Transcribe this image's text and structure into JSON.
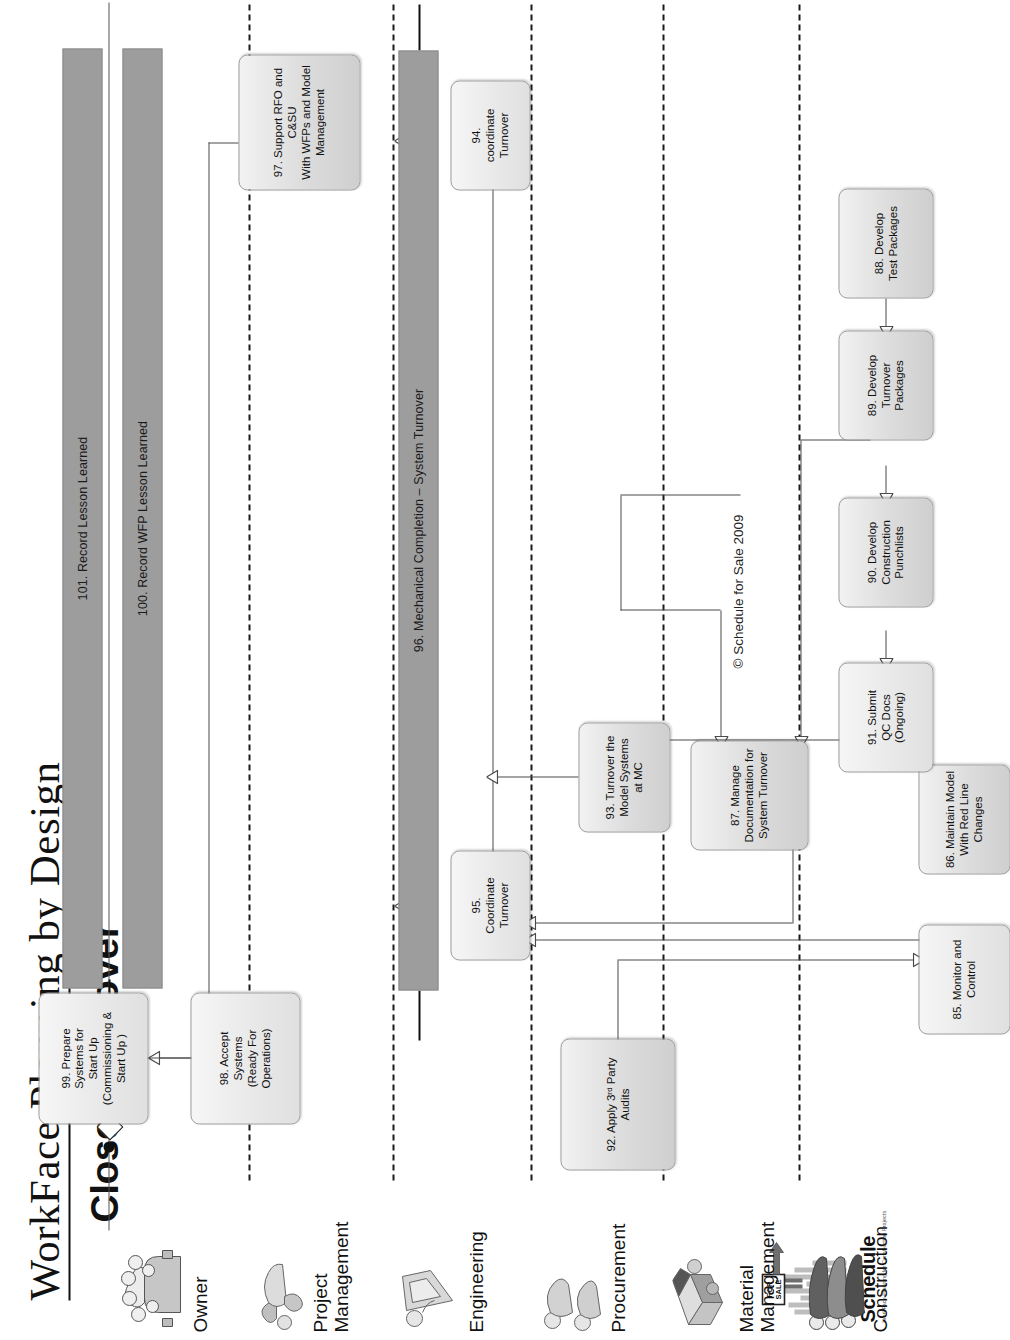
{
  "title": "WorkFace Planning by Design",
  "subtitle": "Close - Turnover",
  "copyright": "© Schedule for Sale 2009",
  "logo": {
    "word": "Schedule",
    "sign": "FOR\nSALE",
    "tagline": "WorkFace Planning for Construction Projects"
  },
  "lanes": [
    {
      "id": "owner",
      "label": "Owner",
      "icon": "people-group-icon"
    },
    {
      "id": "project",
      "label": "Project\nManagement",
      "icon": "person-pointing-icon"
    },
    {
      "id": "engineering",
      "label": "Engineering",
      "icon": "person-document-icon"
    },
    {
      "id": "procurement",
      "label": "Procurement",
      "icon": "two-people-icon"
    },
    {
      "id": "material",
      "label": "Material\nManagement",
      "icon": "truck-box-icon"
    },
    {
      "id": "construction",
      "label": "Construction",
      "icon": "crew-group-icon"
    }
  ],
  "nodes": [
    {
      "id": "n99",
      "lane": "owner",
      "label": "99. Prepare\nSystems for\nStart Up\n(Commissioning &\nStart Up )",
      "shade": "light"
    },
    {
      "id": "n98",
      "lane": "owner",
      "label": "98. Accept\nSystems\n(Ready For\nOperations)",
      "shade": "light"
    },
    {
      "id": "n92",
      "lane": "owner",
      "label": "92. Apply 3ʳᵈ Party Audits",
      "shade": "mid"
    },
    {
      "id": "n95",
      "lane": "project",
      "label": "95.\nCoordinate\nTurnover",
      "shade": "light"
    },
    {
      "id": "n93",
      "lane": "project",
      "label": "93. Turnover the\nModel Systems\nat MC",
      "shade": "mid"
    },
    {
      "id": "n87",
      "lane": "project",
      "label": "87. Manage\nDocumentation for\nSystem Turnover",
      "shade": "mid"
    },
    {
      "id": "n85",
      "lane": "project",
      "label": "85. Monitor and\nControl",
      "shade": "light"
    },
    {
      "id": "n86",
      "lane": "engineering",
      "label": "86. Maintain Model\nWith Red Line\nChanges",
      "shade": "mid"
    },
    {
      "id": "n97",
      "lane": "construction",
      "label": "97. Support RFO and\nC&SU\nWith WFPs and Model\nManagement",
      "shade": "mid"
    },
    {
      "id": "n94",
      "lane": "construction",
      "label": "94.\ncoordinate\nTurnover",
      "shade": "light"
    },
    {
      "id": "n91",
      "lane": "construction",
      "label": "91. Submit\nQC Docs\n(Ongoing)",
      "shade": "light"
    },
    {
      "id": "n90",
      "lane": "construction",
      "label": "90. Develop\nConstruction\nPunchlists",
      "shade": "mid"
    },
    {
      "id": "n89",
      "lane": "construction",
      "label": "89. Develop\nTurnover\nPackages",
      "shade": "mid"
    },
    {
      "id": "n88",
      "lane": "construction",
      "label": "88. Develop\nTest Packages",
      "shade": "mid"
    }
  ],
  "bars": [
    {
      "id": "b101",
      "label": "101. Record Lesson Learned"
    },
    {
      "id": "b100",
      "label": "100. Record WFP Lesson Learned"
    },
    {
      "id": "b96",
      "label": "96. Mechanical Completion – System Turnover"
    }
  ],
  "colors": {
    "bar_fill": "#9d9d9d",
    "node_fill_light": "#e8e8e8",
    "node_fill_mid": "#bcbcbc",
    "line": "#4a4a4a",
    "lane_divider": "#1a1a1a",
    "text": "#111111"
  }
}
